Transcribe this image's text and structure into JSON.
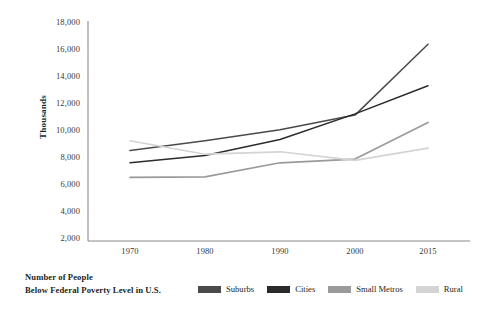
{
  "chart_data": {
    "type": "line",
    "title": "",
    "xlabel": "",
    "ylabel": "Thousands",
    "x": [
      "1970",
      "1980",
      "1990",
      "2000",
      "2015"
    ],
    "categories": [
      "1970",
      "1980",
      "1990",
      "2000",
      "2015"
    ],
    "yticks": [
      "2,000",
      "4,000",
      "6,000",
      "8,000",
      "10,000",
      "12,000",
      "14,000",
      "16,000",
      "18,000"
    ],
    "ytick_values": [
      2000,
      4000,
      6000,
      8000,
      10000,
      12000,
      14000,
      16000,
      18000
    ],
    "ylim": [
      0,
      18000
    ],
    "grid": false,
    "legend_position": "bottom",
    "series": [
      {
        "name": "Suburbs",
        "color": "#4a4a4a",
        "values": [
          7400,
          8200,
          9100,
          10300,
          16100
        ]
      },
      {
        "name": "Cities",
        "color": "#2b2b2b",
        "values": [
          6400,
          7000,
          8300,
          10400,
          12700
        ]
      },
      {
        "name": "Small Metros",
        "color": "#9a9a9a",
        "values": [
          5200,
          5250,
          6400,
          6700,
          9700
        ]
      },
      {
        "name": "Rural",
        "color": "#d4d4d4",
        "values": [
          8200,
          7100,
          7300,
          6600,
          7600
        ]
      }
    ]
  },
  "legend": {
    "title_line1": "Number of People",
    "title_line2": "Below Federal Poverty Level in U.S."
  },
  "colors": {
    "axis": "#8a8a8a",
    "text": "#231f20",
    "tick_text": "#3a3a3a"
  }
}
